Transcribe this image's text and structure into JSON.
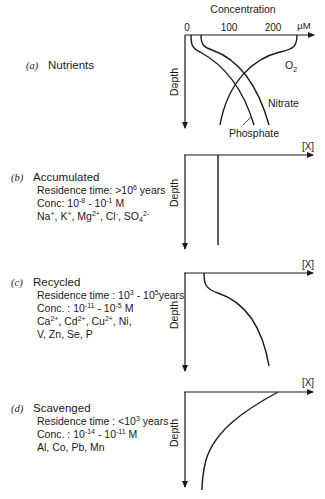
{
  "panel_a": {
    "tag": "(a)",
    "title": "Nutrients",
    "axis_title": "Concentration",
    "unit": "µM",
    "ticks": [
      "0",
      "100",
      "200"
    ],
    "depth_label": "Dəpth",
    "curves": [
      "O2",
      "Nitrate",
      "Phosphate"
    ],
    "o2_label_main": "O",
    "o2_label_sub": "2",
    "nitrate_label": "Nitrate",
    "phosphate_label": "Phosphate"
  },
  "panel_b": {
    "tag": "(b)",
    "title": "Accumulated",
    "residence_prefix": "Residence time: >10",
    "residence_exp": "6",
    "residence_suffix": " years",
    "conc_prefix": "Conc:  10",
    "conc_exp1": "-8",
    "conc_mid": " - 10",
    "conc_exp2": "-1",
    "conc_suffix": " M",
    "ions": "Na+, K+, Mg2+, Cl-, SO42-",
    "x_label": "[X]",
    "depth_label": "Depth"
  },
  "panel_c": {
    "tag": "(c)",
    "title": "Recycled",
    "residence_prefix": "Residence time : 10",
    "residence_exp1": "3",
    "residence_mid": " - 10",
    "residence_exp2": "5",
    "residence_suffix": "years",
    "conc_prefix": "Conc. : 10",
    "conc_exp1": "-11",
    "conc_mid": " - 10",
    "conc_exp2": "-5",
    "conc_suffix": " M",
    "ions_line1": "Ca2+, Cd2+, Cu2+, Ni,",
    "ions_line2": "V, Zn, Se, P",
    "x_label": "[X]",
    "depth_label": "Depth"
  },
  "panel_d": {
    "tag": "(d)",
    "title": "Scavenged",
    "residence_prefix": "Residence time : <10",
    "residence_exp": "3",
    "residence_suffix": " years",
    "conc_prefix": "Conc. : 10",
    "conc_exp1": "-14",
    "conc_mid": " - 10",
    "conc_exp2": "-11",
    "conc_suffix": " M",
    "elements": "Al, Co, Pb, Mn",
    "x_label": "[X]",
    "depth_label": "Depth"
  },
  "ion_parts": {
    "na": "Na",
    "na_sup": "+",
    "k": "K",
    "k_sup": "+",
    "mg": "Mg",
    "mg_sup": "2+",
    "cl": "Cl",
    "cl_sup": "-",
    "so": "SO",
    "so_sub": "4",
    "so_sup": "2-",
    "ca": "Ca",
    "ca_sup": "2+",
    "cd": "Cd",
    "cd_sup": "2+",
    "cu": "Cu",
    "cu_sup": "2+",
    "sep": ", ",
    "ni_tail": ", Ni,"
  }
}
